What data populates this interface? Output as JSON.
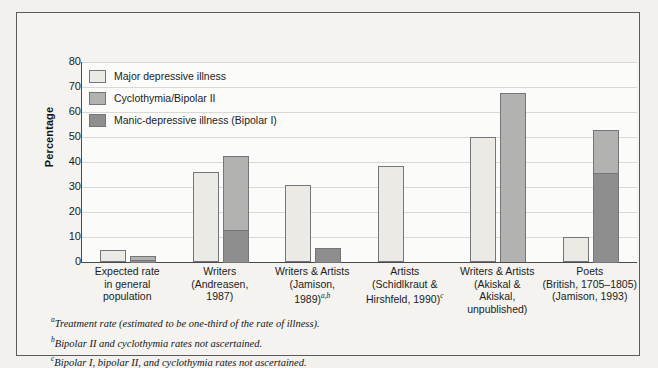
{
  "chart_data": {
    "type": "bar",
    "title": "",
    "subtitle": "",
    "xlabel": "",
    "ylabel": "Percentage",
    "ylim": [
      0,
      80
    ],
    "yticks": [
      0,
      10,
      20,
      30,
      40,
      50,
      60,
      70,
      80
    ],
    "grid": true,
    "legend_position": "top-left",
    "stacked": true,
    "categories": [
      "Expected rate in general population",
      "Writers (Andreasen, 1987)",
      "Writers & Artists (Jamison, 1989)",
      "Artists (Schildkraut & Hirshfeld, 1990)",
      "Writers & Artists (Akiskal & Akiskal, unpublished)",
      "Poets (British, 1705-1805) (Jamison, 1993)"
    ],
    "series": [
      {
        "name": "Major depressive illness",
        "color": "#eceae4",
        "values": [
          5,
          36,
          31,
          38.5,
          50,
          10
        ]
      },
      {
        "name": "Cyclothymia/Bipolar II",
        "color": "#b2b2b0",
        "values": [
          1.5,
          29.5,
          0,
          0,
          67.5,
          17.5
        ]
      },
      {
        "name": "Manic-depressive illness (Bipolar I)",
        "color": "#8e8e8e",
        "values": [
          1,
          13,
          5.5,
          0,
          0,
          35.5
        ]
      }
    ],
    "stack_totals": [
      2.5,
      42.5,
      5.5,
      0,
      67.5,
      53
    ]
  },
  "legend": {
    "items": [
      {
        "label": "Major depressive illness",
        "color": "#eceae4"
      },
      {
        "label": "Cyclothymia/Bipolar II",
        "color": "#b2b2b0"
      },
      {
        "label": "Manic-depressive illness (Bipolar I)",
        "color": "#8e8e8e"
      }
    ]
  },
  "axes": {
    "y_title": "Percentage",
    "y_tick_labels": [
      "80",
      "70",
      "60",
      "50",
      "40",
      "30",
      "20",
      "10",
      "0"
    ]
  },
  "category_labels": [
    {
      "line1": "Expected rate",
      "line2": "in general",
      "line3": "population",
      "line4": ""
    },
    {
      "line1": "Writers",
      "line2": "(Andreasen,",
      "line3": "1987)",
      "line4": ""
    },
    {
      "line1": "Writers & Artists",
      "line2": "(Jamison,",
      "line3": "1989)",
      "sup3": "a,b",
      "line4": ""
    },
    {
      "line1": "Artists",
      "line2": "(Schidlkraut &",
      "line3": "Hirshfeld, 1990)",
      "sup3": "c",
      "line4": ""
    },
    {
      "line1": "Writers & Artists",
      "line2": "(Akiskal &",
      "line3": "Akiskal,",
      "line4": "unpublished)"
    },
    {
      "line1": "Poets",
      "line2": "(British, 1705–1805)",
      "line3": "(Jamison, 1993)",
      "line4": ""
    }
  ],
  "footnotes": [
    {
      "marker": "a",
      "text": "Treatment rate (estimated to be one-third of the rate of illness)."
    },
    {
      "marker": "b",
      "text": "Bipolar II and cyclothymia rates not ascertained."
    },
    {
      "marker": "c",
      "text": "Bipolar I, bipolar II, and cyclothymia rates not ascertained."
    }
  ],
  "colors": {
    "frame": "#5a5a58",
    "axis": "#4a4a48",
    "grid": "#d9d8d2",
    "plot_bg": "#fbfbf9",
    "page_bg": "#f2f1ed"
  }
}
